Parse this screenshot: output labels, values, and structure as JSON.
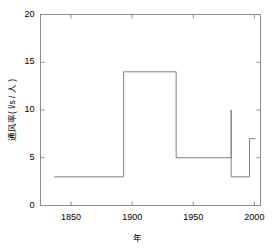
{
  "chart_data": {
    "type": "line",
    "subtype": "step-post",
    "title": "",
    "xlabel": "年",
    "ylabel": "通风率( l/s / 人 )",
    "xlim": [
      1825,
      2005
    ],
    "ylim": [
      0,
      20
    ],
    "xticks": [
      1850,
      1900,
      1950,
      2000
    ],
    "xticklabels": [
      "1850",
      "1900",
      "1950",
      "2000"
    ],
    "yticks": [
      0,
      5,
      10,
      15,
      20
    ],
    "yticklabels": [
      "0",
      "5",
      "10",
      "15",
      "20"
    ],
    "grid": false,
    "legend": null,
    "series": [
      {
        "name": "通风率",
        "x": [
          1836,
          1893,
          1893,
          1936,
          1936,
          1981,
          1981,
          1981,
          1996,
          1996,
          2001
        ],
        "y": [
          3,
          3,
          14,
          14,
          5,
          5,
          10,
          3,
          3,
          7,
          7
        ],
        "color": "#808080"
      }
    ],
    "steps": [
      {
        "x_start": 1836,
        "x_end": 1893,
        "value": 3
      },
      {
        "x_start": 1893,
        "x_end": 1936,
        "value": 14
      },
      {
        "x_start": 1936,
        "x_end": 1981,
        "value": 5
      },
      {
        "x_start": 1981,
        "x_end": 1981,
        "value": 10
      },
      {
        "x_start": 1981,
        "x_end": 1996,
        "value": 3
      },
      {
        "x_start": 1996,
        "x_end": 2001,
        "value": 7
      }
    ]
  },
  "axes": {
    "frame_color": "#8c8c8c",
    "line_color": "#808080",
    "background": "#ffffff"
  }
}
